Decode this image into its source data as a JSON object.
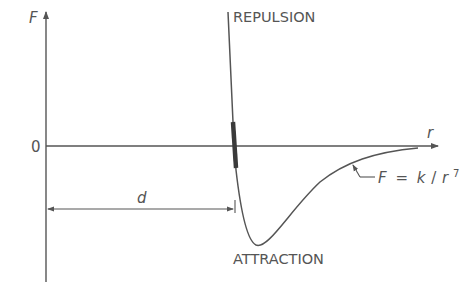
{
  "figure": {
    "axes": {
      "y_label": "F",
      "x_label": "r",
      "origin_label": "0"
    },
    "regions": {
      "repulsion": "REPULSION",
      "attraction": "ATTRACTION"
    },
    "dimension": {
      "label": "d"
    },
    "formula": {
      "lhs": "F",
      "eq": "=",
      "rhs_num": "k",
      "slash": "/",
      "rhs_base": "r",
      "exponent": "7"
    },
    "colors": {
      "line": "#555555",
      "text": "#555555",
      "highlight": "#3a3a3a",
      "background": "#ffffff"
    }
  }
}
